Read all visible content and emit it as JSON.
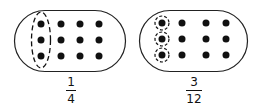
{
  "diagrams": [
    {
      "id": "left",
      "grid": {
        "rows": 3,
        "cols": 4
      },
      "grouping": "one dashed ellipse around the first column",
      "fraction": {
        "numerator": "1",
        "denominator": "4"
      }
    },
    {
      "id": "right",
      "grid": {
        "rows": 3,
        "cols": 4
      },
      "grouping": "three dashed circles, one around each dot in the first column",
      "fraction": {
        "numerator": "3",
        "denominator": "12"
      }
    }
  ],
  "colors": {
    "ink": "#111111",
    "background": "#ffffff"
  }
}
